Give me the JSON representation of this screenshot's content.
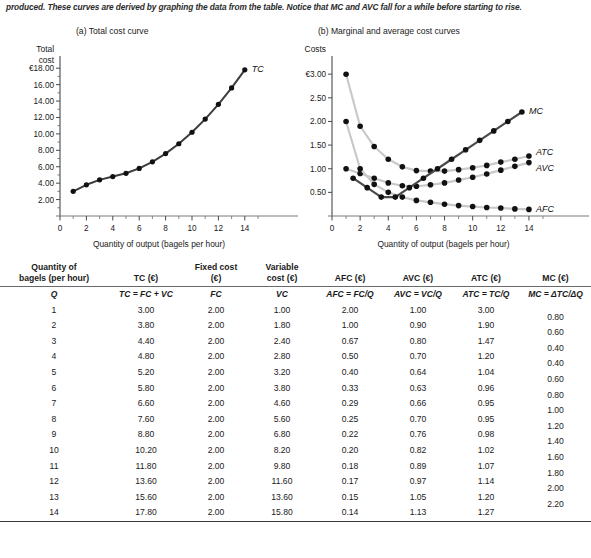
{
  "caption": "produced. These curves are derived by graphing the data from the table. Notice that MC and AVC fall for a while before starting to rise.",
  "panels": {
    "a_title": "(a) Total cost curve",
    "b_title": "(b) Marginal and average cost curves"
  },
  "chart_data": [
    {
      "type": "line",
      "title": "(a) Total cost curve",
      "ylabel_lines": [
        "Total",
        "cost"
      ],
      "xlabel": "Quantity of output (bagels per hour)",
      "x": [
        1,
        2,
        3,
        4,
        5,
        6,
        7,
        8,
        9,
        10,
        11,
        12,
        13,
        14
      ],
      "xlim": [
        0,
        15
      ],
      "ylim": [
        0,
        19
      ],
      "xticks": [
        0,
        2,
        4,
        6,
        8,
        10,
        12,
        14
      ],
      "xtick_labels": [
        "0",
        "2",
        "4",
        "6",
        "8",
        "10",
        "12",
        "14"
      ],
      "yticks": [
        2,
        4,
        6,
        8,
        10,
        12,
        14,
        16,
        18
      ],
      "ytick_labels": [
        "2.00",
        "4.00",
        "6.00",
        "8.00",
        "10.00",
        "12.00",
        "14.00",
        "16.00",
        "€18.00"
      ],
      "grid": false,
      "legend": "none",
      "series": [
        {
          "name": "TC",
          "label": "TC",
          "color": "#3c3c3c",
          "values": [
            3.0,
            3.8,
            4.4,
            4.8,
            5.2,
            5.8,
            6.6,
            7.6,
            8.8,
            10.2,
            11.8,
            13.6,
            15.6,
            17.8
          ]
        }
      ]
    },
    {
      "type": "line",
      "title": "(b) Marginal and average cost curves",
      "ylabel_lines": [
        "Costs"
      ],
      "xlabel": "Quantity of output (bagels per hour)",
      "x": [
        1,
        2,
        3,
        4,
        5,
        6,
        7,
        8,
        9,
        10,
        11,
        12,
        13,
        14
      ],
      "xlim": [
        0,
        15
      ],
      "ylim": [
        0,
        3.3
      ],
      "xticks": [
        0,
        2,
        4,
        6,
        8,
        10,
        12,
        14
      ],
      "xtick_labels": [
        "0",
        "2",
        "4",
        "6",
        "8",
        "10",
        "12",
        "14"
      ],
      "yticks": [
        0.5,
        1.0,
        1.5,
        2.0,
        2.5,
        3.0
      ],
      "ytick_labels": [
        "0.50",
        "1.00",
        "1.50",
        "2.00",
        "2.50",
        "€3.00"
      ],
      "grid": false,
      "legend": "curve-end-labels",
      "series": [
        {
          "name": "ATC",
          "label": "ATC",
          "color": "#c9c9c9",
          "values": [
            3.0,
            1.9,
            1.47,
            1.2,
            1.04,
            0.96,
            0.95,
            0.95,
            0.98,
            1.02,
            1.07,
            1.14,
            1.2,
            1.27
          ]
        },
        {
          "name": "AVC",
          "label": "AVC",
          "color": "#c9c9c9",
          "values": [
            1.0,
            0.9,
            0.8,
            0.7,
            0.64,
            0.63,
            0.66,
            0.7,
            0.76,
            0.82,
            0.89,
            0.97,
            1.05,
            1.13
          ]
        },
        {
          "name": "AFC",
          "label": "AFC",
          "color": "#c9c9c9",
          "values": [
            2.0,
            1.0,
            0.67,
            0.5,
            0.4,
            0.33,
            0.29,
            0.25,
            0.22,
            0.2,
            0.18,
            0.17,
            0.15,
            0.14
          ]
        },
        {
          "name": "MC",
          "label": "MC",
          "color": "#4a4a4a",
          "x": [
            1.5,
            2.5,
            3.5,
            4.5,
            5.5,
            6.5,
            7.5,
            8.5,
            9.5,
            10.5,
            11.5,
            12.5,
            13.5
          ],
          "values": [
            0.8,
            0.6,
            0.4,
            0.4,
            0.6,
            0.8,
            1.0,
            1.2,
            1.4,
            1.6,
            1.8,
            2.0,
            2.2
          ]
        }
      ]
    }
  ],
  "table": {
    "headers": [
      "Quantity of bagels (per hour)",
      "TC (€)",
      "Fixed cost (€)",
      "Variable cost (€)",
      "AFC (€)",
      "AVC (€)",
      "ATC (€)",
      "MC (€)"
    ],
    "header_lines": [
      [
        "Quantity of",
        "bagels (per hour)"
      ],
      [
        "",
        "TC (€)"
      ],
      [
        "Fixed cost",
        "(€)"
      ],
      [
        "Variable",
        "cost (€)"
      ],
      [
        "",
        "AFC (€)"
      ],
      [
        "",
        "AVC (€)"
      ],
      [
        "",
        "ATC (€)"
      ],
      [
        "",
        "MC (€)"
      ]
    ],
    "formulas": [
      "Q",
      "TC = FC + VC",
      "FC",
      "VC",
      "AFC = FC/Q",
      "AVC = VC/Q",
      "ATC = TC/Q",
      "MC = ΔTC/ΔQ"
    ],
    "rows": [
      {
        "q": "1",
        "tc": "3.00",
        "fc": "2.00",
        "vc": "1.00",
        "afc": "2.00",
        "avc": "1.00",
        "atc": "3.00",
        "mc": "0.80"
      },
      {
        "q": "2",
        "tc": "3.80",
        "fc": "2.00",
        "vc": "1.80",
        "afc": "1.00",
        "avc": "0.90",
        "atc": "1.90",
        "mc": "0.60"
      },
      {
        "q": "3",
        "tc": "4.40",
        "fc": "2.00",
        "vc": "2.40",
        "afc": "0.67",
        "avc": "0.80",
        "atc": "1.47",
        "mc": "0.40"
      },
      {
        "q": "4",
        "tc": "4.80",
        "fc": "2.00",
        "vc": "2.80",
        "afc": "0.50",
        "avc": "0.70",
        "atc": "1.20",
        "mc": "0.40"
      },
      {
        "q": "5",
        "tc": "5.20",
        "fc": "2.00",
        "vc": "3.20",
        "afc": "0.40",
        "avc": "0.64",
        "atc": "1.04",
        "mc": "0.60"
      },
      {
        "q": "6",
        "tc": "5.80",
        "fc": "2.00",
        "vc": "3.80",
        "afc": "0.33",
        "avc": "0.63",
        "atc": "0.96",
        "mc": "0.80"
      },
      {
        "q": "7",
        "tc": "6.60",
        "fc": "2.00",
        "vc": "4.60",
        "afc": "0.29",
        "avc": "0.66",
        "atc": "0.95",
        "mc": "1.00"
      },
      {
        "q": "8",
        "tc": "7.60",
        "fc": "2.00",
        "vc": "5.60",
        "afc": "0.25",
        "avc": "0.70",
        "atc": "0.95",
        "mc": "1.20"
      },
      {
        "q": "9",
        "tc": "8.80",
        "fc": "2.00",
        "vc": "6.80",
        "afc": "0.22",
        "avc": "0.76",
        "atc": "0.98",
        "mc": "1.40"
      },
      {
        "q": "10",
        "tc": "10.20",
        "fc": "2.00",
        "vc": "8.20",
        "afc": "0.20",
        "avc": "0.82",
        "atc": "1.02",
        "mc": "1.60"
      },
      {
        "q": "11",
        "tc": "11.80",
        "fc": "2.00",
        "vc": "9.80",
        "afc": "0.18",
        "avc": "0.89",
        "atc": "1.07",
        "mc": "1.80"
      },
      {
        "q": "12",
        "tc": "13.60",
        "fc": "2.00",
        "vc": "11.60",
        "afc": "0.17",
        "avc": "0.97",
        "atc": "1.14",
        "mc": "2.00"
      },
      {
        "q": "13",
        "tc": "15.60",
        "fc": "2.00",
        "vc": "13.60",
        "afc": "0.15",
        "avc": "1.05",
        "atc": "1.20",
        "mc": "2.20"
      },
      {
        "q": "14",
        "tc": "17.80",
        "fc": "2.00",
        "vc": "15.80",
        "afc": "0.14",
        "avc": "1.13",
        "atc": "1.27",
        "mc": ""
      }
    ]
  }
}
